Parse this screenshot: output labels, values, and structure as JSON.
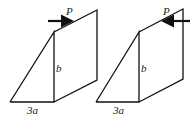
{
  "figures": [
    {
      "id": "left",
      "force_label": "P",
      "force_direction": "right",
      "height_label": "b",
      "base_label": "3a"
    },
    {
      "id": "right",
      "force_label": "P",
      "force_direction": "left",
      "height_label": "b",
      "base_label": "3a"
    }
  ],
  "colors": {
    "stroke": "#111111"
  }
}
